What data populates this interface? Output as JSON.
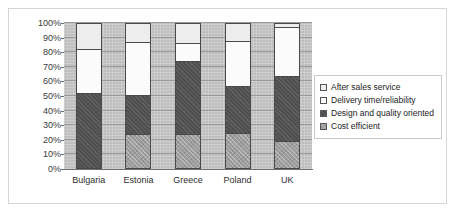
{
  "chart_data": {
    "type": "bar",
    "subtype": "stacked-100-percent",
    "title": "",
    "xlabel": "",
    "ylabel": "",
    "ylim": [
      0,
      100
    ],
    "ytick_labels": [
      "100%",
      "90%",
      "80%",
      "70%",
      "60%",
      "50%",
      "40%",
      "30%",
      "20%",
      "10%",
      "0%"
    ],
    "ytick_values": [
      100,
      90,
      80,
      70,
      60,
      50,
      40,
      30,
      20,
      10,
      0
    ],
    "grid": true,
    "legend_position": "right",
    "categories": [
      "Bulgaria",
      "Estonia",
      "Greece",
      "Poland",
      "UK"
    ],
    "series": [
      {
        "name": "Cost efficient",
        "color": "#9e9e9e",
        "values": [
          0,
          24,
          24,
          25,
          19
        ]
      },
      {
        "name": "Design and quality oriented",
        "color": "#4f4f4f",
        "values": [
          52,
          27,
          50,
          32,
          45
        ]
      },
      {
        "name": "Delivery time/reliability",
        "color": "#fbfbfb",
        "values": [
          30,
          36,
          12,
          31,
          33
        ]
      },
      {
        "name": "After sales service",
        "color": "#ededed",
        "values": [
          18,
          13,
          14,
          12,
          3
        ]
      }
    ]
  },
  "legend": {
    "items": [
      {
        "label": "After sales service",
        "swatch": "aftersales"
      },
      {
        "label": "Delivery time/reliability",
        "swatch": "delivery"
      },
      {
        "label": "Design and quality oriented",
        "swatch": "design"
      },
      {
        "label": "Cost efficient",
        "swatch": "cost"
      }
    ]
  }
}
